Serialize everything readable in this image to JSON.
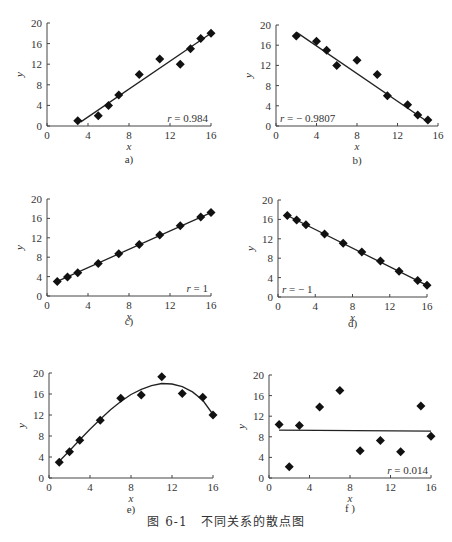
{
  "caption": "图 6-1　不同关系的散点图",
  "chart_data": [
    {
      "id": "a",
      "type": "scatter",
      "sublabel": "a)",
      "xlabel": "x",
      "ylabel": "y",
      "xlim": [
        0,
        16
      ],
      "ylim": [
        0,
        20
      ],
      "xticks": [
        0,
        4,
        8,
        12,
        16
      ],
      "yticks": [
        0,
        4,
        8,
        12,
        16,
        20
      ],
      "annotation": "r = 0.984",
      "annotation_pos": "bottom-right",
      "points": [
        [
          3,
          1
        ],
        [
          5,
          2
        ],
        [
          6,
          4
        ],
        [
          7,
          6
        ],
        [
          9,
          10
        ],
        [
          11,
          13
        ],
        [
          13,
          12
        ],
        [
          14,
          15
        ],
        [
          15,
          17
        ],
        [
          16,
          18
        ]
      ],
      "fit": {
        "kind": "linear",
        "from": [
          3.3,
          0.8
        ],
        "to": [
          16,
          18
        ]
      }
    },
    {
      "id": "b",
      "type": "scatter",
      "sublabel": "b)",
      "xlabel": "x",
      "ylabel": "y",
      "xlim": [
        0,
        16
      ],
      "ylim": [
        0,
        20
      ],
      "xticks": [
        0,
        4,
        8,
        12,
        16
      ],
      "yticks": [
        0,
        4,
        8,
        12,
        16,
        20
      ],
      "annotation": "r = − 0.9807",
      "annotation_pos": "bottom-left",
      "points": [
        [
          2,
          17.8
        ],
        [
          4,
          16.8
        ],
        [
          5,
          15
        ],
        [
          6,
          12
        ],
        [
          8,
          13
        ],
        [
          10,
          10.2
        ],
        [
          11,
          6
        ],
        [
          13,
          4.2
        ],
        [
          14,
          2.2
        ],
        [
          15,
          1.2
        ]
      ],
      "fit": {
        "kind": "linear",
        "from": [
          2,
          18.6
        ],
        "to": [
          15,
          0.8
        ]
      }
    },
    {
      "id": "c",
      "type": "scatter",
      "sublabel": "c)",
      "xlabel": "x",
      "ylabel": "y",
      "xlim": [
        0,
        16
      ],
      "ylim": [
        0,
        20
      ],
      "xticks": [
        0,
        4,
        8,
        12,
        16
      ],
      "yticks": [
        0,
        4,
        8,
        12,
        16,
        20
      ],
      "annotation": "r = 1",
      "annotation_pos": "bottom-right",
      "points": [
        [
          1,
          3
        ],
        [
          2,
          3.9
        ],
        [
          3,
          4.8
        ],
        [
          5,
          6.7
        ],
        [
          7,
          8.7
        ],
        [
          9,
          10.6
        ],
        [
          11,
          12.6
        ],
        [
          13,
          14.5
        ],
        [
          15,
          16.3
        ],
        [
          16,
          17.2
        ]
      ],
      "fit": {
        "kind": "linear",
        "from": [
          1,
          3
        ],
        "to": [
          16,
          17.2
        ]
      }
    },
    {
      "id": "d",
      "type": "scatter",
      "sublabel": "d)",
      "xlabel": "x",
      "ylabel": "y",
      "xlim": [
        0,
        16
      ],
      "ylim": [
        0,
        20
      ],
      "xticks": [
        0,
        4,
        8,
        12,
        16
      ],
      "yticks": [
        0,
        4,
        8,
        12,
        16,
        20
      ],
      "annotation": "r = − 1",
      "annotation_pos": "bottom-left",
      "points": [
        [
          1,
          16.8
        ],
        [
          2,
          15.9
        ],
        [
          3,
          14.9
        ],
        [
          5,
          13
        ],
        [
          7,
          11.1
        ],
        [
          9,
          9.3
        ],
        [
          11,
          7.4
        ],
        [
          13,
          5.3
        ],
        [
          15,
          3.4
        ],
        [
          16,
          2.4
        ]
      ],
      "fit": {
        "kind": "linear",
        "from": [
          1,
          16.8
        ],
        "to": [
          16,
          2.4
        ]
      }
    },
    {
      "id": "e",
      "type": "scatter",
      "sublabel": "e)",
      "xlabel": "x",
      "ylabel": "y",
      "xlim": [
        0,
        16
      ],
      "ylim": [
        0,
        20
      ],
      "xticks": [
        0,
        4,
        8,
        12,
        16
      ],
      "yticks": [
        0,
        4,
        8,
        12,
        16,
        20
      ],
      "annotation": "",
      "points": [
        [
          1,
          3
        ],
        [
          2,
          5
        ],
        [
          3,
          7.2
        ],
        [
          5,
          11
        ],
        [
          7,
          15.2
        ],
        [
          9,
          15.8
        ],
        [
          11,
          19.3
        ],
        [
          13,
          16.1
        ],
        [
          15,
          15.4
        ],
        [
          16,
          12
        ]
      ],
      "fit": {
        "kind": "curve",
        "samples": [
          [
            1,
            3.2
          ],
          [
            2,
            5.2
          ],
          [
            3,
            7.3
          ],
          [
            4,
            9.3
          ],
          [
            5,
            11.2
          ],
          [
            6,
            13
          ],
          [
            7,
            14.6
          ],
          [
            8,
            15.9
          ],
          [
            9,
            16.9
          ],
          [
            10,
            17.6
          ],
          [
            11,
            18
          ],
          [
            12,
            17.9
          ],
          [
            13,
            17.4
          ],
          [
            14,
            16.4
          ],
          [
            15,
            14.8
          ],
          [
            16,
            12.1
          ]
        ]
      }
    },
    {
      "id": "f",
      "type": "scatter",
      "sublabel": "f )",
      "xlabel": "x",
      "ylabel": "y",
      "xlim": [
        0,
        16
      ],
      "ylim": [
        0,
        20
      ],
      "xticks": [
        0,
        4,
        8,
        12,
        16
      ],
      "yticks": [
        0,
        4,
        8,
        12,
        16,
        20
      ],
      "annotation": "r = 0.014",
      "annotation_pos": "bottom-right",
      "points": [
        [
          1,
          10.4
        ],
        [
          2,
          2.2
        ],
        [
          3,
          10.2
        ],
        [
          5,
          13.8
        ],
        [
          7,
          17
        ],
        [
          9,
          5.3
        ],
        [
          11,
          7.3
        ],
        [
          13,
          5.1
        ],
        [
          15,
          14
        ],
        [
          16,
          8.1
        ]
      ],
      "fit": {
        "kind": "linear",
        "from": [
          1,
          9.3
        ],
        "to": [
          16,
          9.1
        ]
      }
    }
  ],
  "panel_layout": [
    {
      "id": "a",
      "x0": 47,
      "x1": 211,
      "yTop": 23,
      "yBot": 126,
      "subY": 163
    },
    {
      "id": "b",
      "x0": 276,
      "x1": 438,
      "yTop": 25,
      "yBot": 126,
      "subY": 164
    },
    {
      "id": "c",
      "x0": 47,
      "x1": 211,
      "yTop": 199,
      "yBot": 296,
      "subY": 325
    },
    {
      "id": "d",
      "x0": 278,
      "x1": 427,
      "yTop": 200,
      "yBot": 297,
      "subY": 327
    },
    {
      "id": "e",
      "x0": 49,
      "x1": 213,
      "yTop": 373,
      "yBot": 478,
      "subY": 513
    },
    {
      "id": "f",
      "x0": 269,
      "x1": 431,
      "yTop": 375,
      "yBot": 478,
      "subY": 512
    }
  ]
}
